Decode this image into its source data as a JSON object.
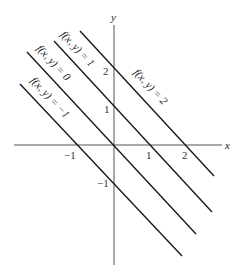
{
  "diagram": {
    "type": "level-curves",
    "function": "f(x, y) = x + y",
    "axes": {
      "x_label": "x",
      "y_label": "y",
      "x_ticks": [
        {
          "value": -1,
          "label": "−1"
        },
        {
          "value": 1,
          "label": "1"
        },
        {
          "value": 2,
          "label": "2"
        }
      ],
      "y_ticks": [
        {
          "value": 2,
          "label": "2"
        },
        {
          "value": 1,
          "label": "1"
        },
        {
          "value": -1,
          "label": "−1"
        }
      ]
    },
    "level_curves": [
      {
        "c": 2,
        "label": "f(x, y) = 2"
      },
      {
        "c": 1,
        "label": "f(x, y) = 1"
      },
      {
        "c": 0,
        "label": "f(x, y) = 0"
      },
      {
        "c": -1,
        "label": "f(x, y) = −1"
      }
    ]
  }
}
